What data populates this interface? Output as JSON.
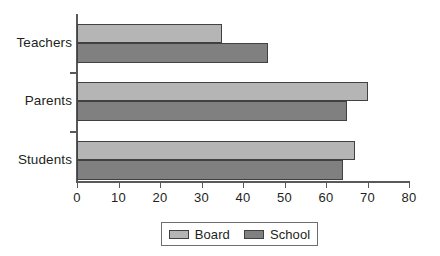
{
  "chart_data": {
    "type": "bar",
    "orientation": "horizontal",
    "title": "",
    "xlabel": "",
    "ylabel": "",
    "categories": [
      "Teachers",
      "Parents",
      "Students"
    ],
    "series": [
      {
        "name": "Board",
        "color": "#b5b5b5",
        "values": [
          35,
          70,
          67
        ]
      },
      {
        "name": "School",
        "color": "#808080",
        "values": [
          46,
          65,
          64
        ]
      }
    ],
    "xlim": [
      0,
      80
    ],
    "xticks": [
      0,
      10,
      20,
      30,
      40,
      50,
      60,
      70,
      80
    ],
    "xtick_labels": [
      "0",
      "10",
      "20",
      "30",
      "40",
      "50",
      "60",
      "70",
      "80"
    ],
    "grid": false,
    "legend_position": "bottom-center",
    "legend_entries": [
      "Board",
      "School"
    ]
  },
  "colors": {
    "board": "#b5b5b5",
    "school": "#808080",
    "axis": "#58595b",
    "bar_border": "#414042",
    "text": "#231f20",
    "background": "#ffffff"
  }
}
